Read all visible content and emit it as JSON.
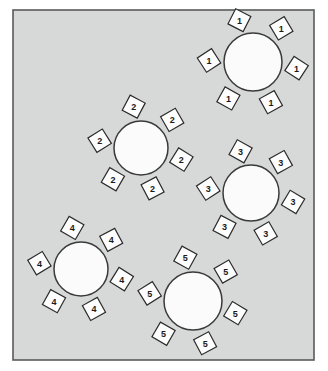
{
  "colors": {
    "page_background": "#ffffff",
    "room_floor": "#d7d8d8",
    "room_border": "#5a5a5a",
    "table_fill": "#fbfbfb",
    "table_stroke": "#3a3a3a",
    "chair_fill": "#fdfdfd",
    "chair_stroke": "#2b2b2b",
    "label_text": "#1a1a1a"
  },
  "room": {
    "x": 13,
    "y": 10,
    "width": 301,
    "height": 350,
    "border_width": 1.6
  },
  "tables": [
    {
      "id": "table-1",
      "number": "1",
      "cx": 253,
      "cy": 62,
      "r": 29,
      "seat_count": 6,
      "chair_size": 17,
      "chair_orbit": 44,
      "start_angle": -108,
      "seats": [
        {
          "label": "1",
          "angle": -108,
          "tilt": -18
        },
        {
          "label": "1",
          "angle": -50,
          "tilt": 14
        },
        {
          "label": "1",
          "angle": 8,
          "tilt": -12
        },
        {
          "label": "1",
          "angle": 66,
          "tilt": 16
        },
        {
          "label": "1",
          "angle": 124,
          "tilt": -16
        },
        {
          "label": "1",
          "angle": 182,
          "tilt": 12
        }
      ]
    },
    {
      "id": "table-2",
      "number": "2",
      "cx": 141,
      "cy": 148,
      "r": 27,
      "seat_count": 6,
      "chair_size": 17,
      "chair_orbit": 42,
      "start_angle": -100,
      "seats": [
        {
          "label": "2",
          "angle": -100,
          "tilt": -17
        },
        {
          "label": "2",
          "angle": -42,
          "tilt": 15
        },
        {
          "label": "2",
          "angle": 16,
          "tilt": -13
        },
        {
          "label": "2",
          "angle": 74,
          "tilt": 17
        },
        {
          "label": "2",
          "angle": 132,
          "tilt": -15
        },
        {
          "label": "2",
          "angle": 190,
          "tilt": 13
        }
      ]
    },
    {
      "id": "table-3",
      "number": "3",
      "cx": 251,
      "cy": 193,
      "r": 28,
      "seat_count": 6,
      "chair_size": 17,
      "chair_orbit": 43,
      "start_angle": -104,
      "seats": [
        {
          "label": "3",
          "angle": -104,
          "tilt": -16
        },
        {
          "label": "3",
          "angle": -46,
          "tilt": 16
        },
        {
          "label": "3",
          "angle": 12,
          "tilt": -14
        },
        {
          "label": "3",
          "angle": 70,
          "tilt": 15
        },
        {
          "label": "3",
          "angle": 128,
          "tilt": -17
        },
        {
          "label": "3",
          "angle": 186,
          "tilt": 12
        }
      ]
    },
    {
      "id": "table-4",
      "number": "4",
      "cx": 81,
      "cy": 269,
      "r": 27,
      "seat_count": 6,
      "chair_size": 17,
      "chair_orbit": 42,
      "start_angle": -102,
      "seats": [
        {
          "label": "4",
          "angle": -102,
          "tilt": -15
        },
        {
          "label": "4",
          "angle": -44,
          "tilt": 17
        },
        {
          "label": "4",
          "angle": 14,
          "tilt": -13
        },
        {
          "label": "4",
          "angle": 72,
          "tilt": 16
        },
        {
          "label": "4",
          "angle": 130,
          "tilt": -16
        },
        {
          "label": "4",
          "angle": 188,
          "tilt": 14
        }
      ]
    },
    {
      "id": "table-5",
      "number": "5",
      "cx": 193,
      "cy": 301,
      "r": 29,
      "seat_count": 6,
      "chair_size": 17,
      "chair_orbit": 44,
      "start_angle": -100,
      "seats": [
        {
          "label": "5",
          "angle": -100,
          "tilt": -16
        },
        {
          "label": "5",
          "angle": -42,
          "tilt": 15
        },
        {
          "label": "5",
          "angle": 16,
          "tilt": -14
        },
        {
          "label": "5",
          "angle": 74,
          "tilt": 17
        },
        {
          "label": "5",
          "angle": 132,
          "tilt": -15
        },
        {
          "label": "5",
          "angle": 190,
          "tilt": 13
        }
      ]
    }
  ]
}
